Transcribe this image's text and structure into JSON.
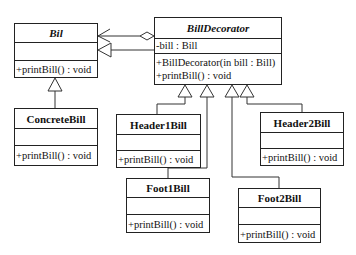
{
  "diagram": {
    "type": "uml-class-diagram",
    "classes": {
      "bil": {
        "name": "Bil",
        "abstract": true,
        "attributes": [],
        "methods": [
          "+printBill() : void"
        ]
      },
      "concrete_bill": {
        "name": "ConcreteBill",
        "attributes": [],
        "methods": [
          "+printBill() : void"
        ]
      },
      "bill_decorator": {
        "name": "BillDecorator",
        "abstract": true,
        "attributes": [
          "-bill : Bill"
        ],
        "methods": [
          "+BillDecorator(in bill : Bill)",
          "+printBill() : void"
        ]
      },
      "header1_bill": {
        "name": "Header1Bill",
        "attributes": [],
        "methods": [
          "+printBill() : void"
        ]
      },
      "header2_bill": {
        "name": "Header2Bill",
        "attributes": [],
        "methods": [
          "+printBill() : void"
        ]
      },
      "foot1_bill": {
        "name": "Foot1Bill",
        "attributes": [],
        "methods": [
          "+printBill() : void"
        ]
      },
      "foot2_bill": {
        "name": "Foot2Bill",
        "attributes": [],
        "methods": [
          "+printBill() : void"
        ]
      }
    },
    "relationships": [
      {
        "from": "ConcreteBill",
        "to": "Bil",
        "type": "generalization"
      },
      {
        "from": "BillDecorator",
        "to": "Bil",
        "type": "generalization"
      },
      {
        "from": "BillDecorator",
        "to": "Bil",
        "type": "aggregation"
      },
      {
        "from": "Header1Bill",
        "to": "BillDecorator",
        "type": "generalization"
      },
      {
        "from": "Foot1Bill",
        "to": "BillDecorator",
        "type": "generalization"
      },
      {
        "from": "Foot2Bill",
        "to": "BillDecorator",
        "type": "generalization"
      },
      {
        "from": "Header2Bill",
        "to": "BillDecorator",
        "type": "generalization"
      }
    ]
  }
}
